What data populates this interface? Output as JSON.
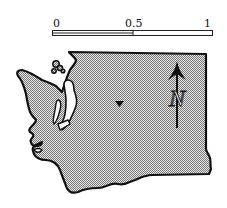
{
  "map": {
    "region": "Washington State outline",
    "fill_color": "#b8b8b8",
    "outline_color": "#111111",
    "location_marker": "triangle-down",
    "north_arrow": {
      "label": "N"
    }
  },
  "scale_bar": {
    "ticks": [
      {
        "label": "0"
      },
      {
        "label": "0.5"
      },
      {
        "label": "1"
      }
    ]
  }
}
